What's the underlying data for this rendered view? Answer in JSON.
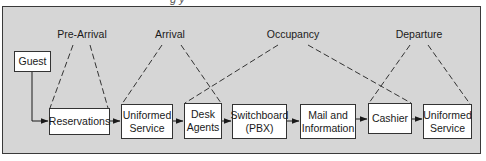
{
  "diagram": {
    "caption_partial": "g            y",
    "phases": [
      {
        "id": "pre-arrival",
        "label": "Pre-Arrival"
      },
      {
        "id": "arrival",
        "label": "Arrival"
      },
      {
        "id": "occupancy",
        "label": "Occupancy"
      },
      {
        "id": "departure",
        "label": "Departure"
      }
    ],
    "nodes": [
      {
        "id": "guest",
        "label": "Guest"
      },
      {
        "id": "reservations",
        "label": "Reservations"
      },
      {
        "id": "uniformed-service-1",
        "label": "Uniformed\nService"
      },
      {
        "id": "desk-agents",
        "label": "Desk\nAgents"
      },
      {
        "id": "switchboard",
        "label": "Switchboard\n(PBX)"
      },
      {
        "id": "mail-information",
        "label": "Mail and\nInformation"
      },
      {
        "id": "cashier",
        "label": "Cashier"
      },
      {
        "id": "uniformed-service-2",
        "label": "Uniformed\nService"
      }
    ],
    "flow_edges": [
      {
        "from": "guest",
        "to": "reservations"
      },
      {
        "from": "reservations",
        "to": "uniformed-service-1"
      },
      {
        "from": "uniformed-service-1",
        "to": "desk-agents"
      },
      {
        "from": "desk-agents",
        "to": "switchboard"
      },
      {
        "from": "switchboard",
        "to": "mail-information"
      },
      {
        "from": "mail-information",
        "to": "cashier"
      },
      {
        "from": "cashier",
        "to": "uniformed-service-2"
      }
    ],
    "phase_links": [
      {
        "phase": "pre-arrival",
        "spans": [
          "reservations"
        ]
      },
      {
        "phase": "arrival",
        "spans": [
          "uniformed-service-1",
          "desk-agents"
        ]
      },
      {
        "phase": "occupancy",
        "spans": [
          "desk-agents",
          "cashier"
        ]
      },
      {
        "phase": "departure",
        "spans": [
          "cashier",
          "uniformed-service-2"
        ]
      }
    ]
  }
}
